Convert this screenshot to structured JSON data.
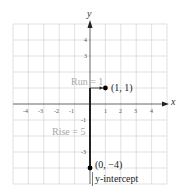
{
  "axes": {
    "x_label": "x",
    "y_label": "y",
    "x_ticks": [
      "-4",
      "-3",
      "-2",
      "-1",
      "1",
      "2",
      "3",
      "4"
    ],
    "y_ticks_shown": [
      "4",
      "3",
      "-1",
      "-3"
    ],
    "range": {
      "x": [
        -5,
        5
      ],
      "y": [
        -5,
        5
      ]
    }
  },
  "points": [
    {
      "label": "(1, 1)",
      "x": 1,
      "y": 1
    },
    {
      "label": "(0, −4)",
      "x": 0,
      "y": -4
    }
  ],
  "annotations": {
    "run": "Run = 1",
    "rise": "Rise = 5",
    "intercept": "y-intercept"
  },
  "colors": {
    "grid": "#d6d6d6",
    "axis": "#2a2a2a",
    "muted_text": "#a8a8a8",
    "text": "#222222"
  }
}
